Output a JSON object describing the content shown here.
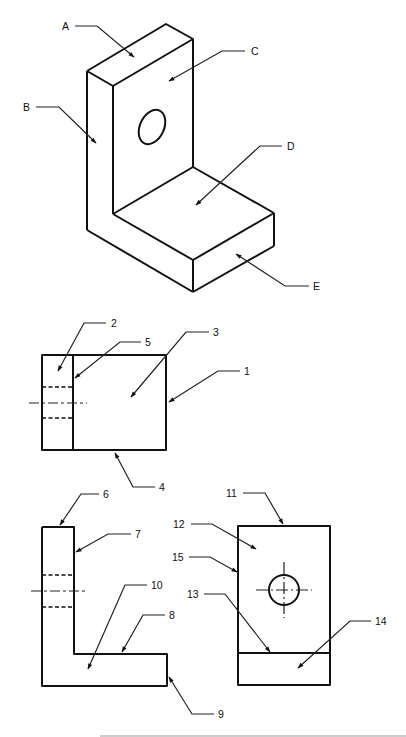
{
  "drawing": {
    "title": "L-bracket multiview identification exercise",
    "isometric_labels": [
      "A",
      "B",
      "C",
      "D",
      "E"
    ],
    "top_view_labels": [
      "1",
      "2",
      "3",
      "4",
      "5"
    ],
    "front_view_labels": [
      "6",
      "7",
      "8",
      "9",
      "10"
    ],
    "side_view_labels": [
      "11",
      "12",
      "13",
      "14",
      "15"
    ]
  },
  "colors": {
    "line": "#111111",
    "background": "#ffffff",
    "rule": "#bdbdbd"
  }
}
